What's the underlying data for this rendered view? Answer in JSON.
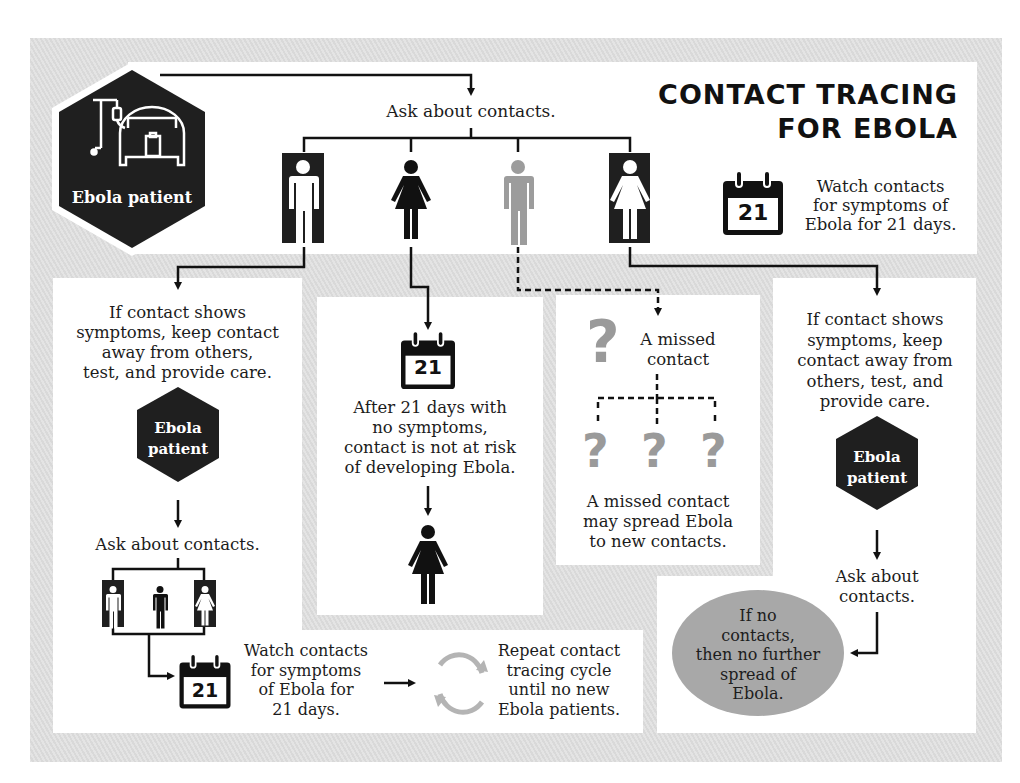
{
  "title": {
    "line1": "CONTACT TRACING",
    "line2": "FOR EBOLA"
  },
  "colors": {
    "background_stripe": "#dcdcdc",
    "panel": "#ffffff",
    "dark": "#1f1f1f",
    "missed_gray": "#9a9a9a",
    "ellipse": "#a8a8a8"
  },
  "start_node": {
    "label": "Ebola patient",
    "icon": "hospital-bed-icon"
  },
  "top": {
    "ask_contacts": "Ask about contacts.",
    "contacts": [
      {
        "type": "man",
        "style": "boxed-white",
        "icon": "man-icon"
      },
      {
        "type": "woman",
        "style": "black",
        "icon": "woman-icon"
      },
      {
        "type": "man",
        "style": "gray-missed",
        "icon": "man-icon"
      },
      {
        "type": "woman",
        "style": "boxed-white",
        "icon": "woman-icon"
      }
    ],
    "calendar_number": "21",
    "watch_text": [
      "Watch contacts",
      "for symptoms of",
      "Ebola for 21 days."
    ]
  },
  "left_branch": {
    "symptoms_text": [
      "If contact shows",
      "symptoms, keep contact",
      "away from others,",
      "test, and provide care."
    ],
    "patient_label": [
      "Ebola",
      "patient"
    ],
    "ask_contacts": "Ask about contacts.",
    "calendar_number": "21",
    "watch_text": [
      "Watch contacts",
      "for symptoms",
      "of Ebola for",
      "21 days."
    ],
    "repeat_text": [
      "Repeat contact",
      "tracing cycle",
      "until no new",
      "Ebola patients."
    ]
  },
  "middle_branch": {
    "calendar_number": "21",
    "text": [
      "After 21 days with",
      "no symptoms,",
      "contact is not at risk",
      "of developing Ebola."
    ]
  },
  "missed_branch": {
    "label": [
      "A missed",
      "contact"
    ],
    "spread_text": [
      "A missed contact",
      "may spread Ebola",
      "to new contacts."
    ],
    "question_mark": "?"
  },
  "right_branch": {
    "symptoms_text": [
      "If contact shows",
      "symptoms, keep",
      "contact away from",
      "others, test, and",
      "provide care."
    ],
    "patient_label": [
      "Ebola",
      "patient"
    ],
    "ask_contacts": [
      "Ask about",
      "contacts."
    ],
    "end_text": [
      "If no",
      "contacts,",
      "then no further",
      "spread of",
      "Ebola."
    ]
  }
}
